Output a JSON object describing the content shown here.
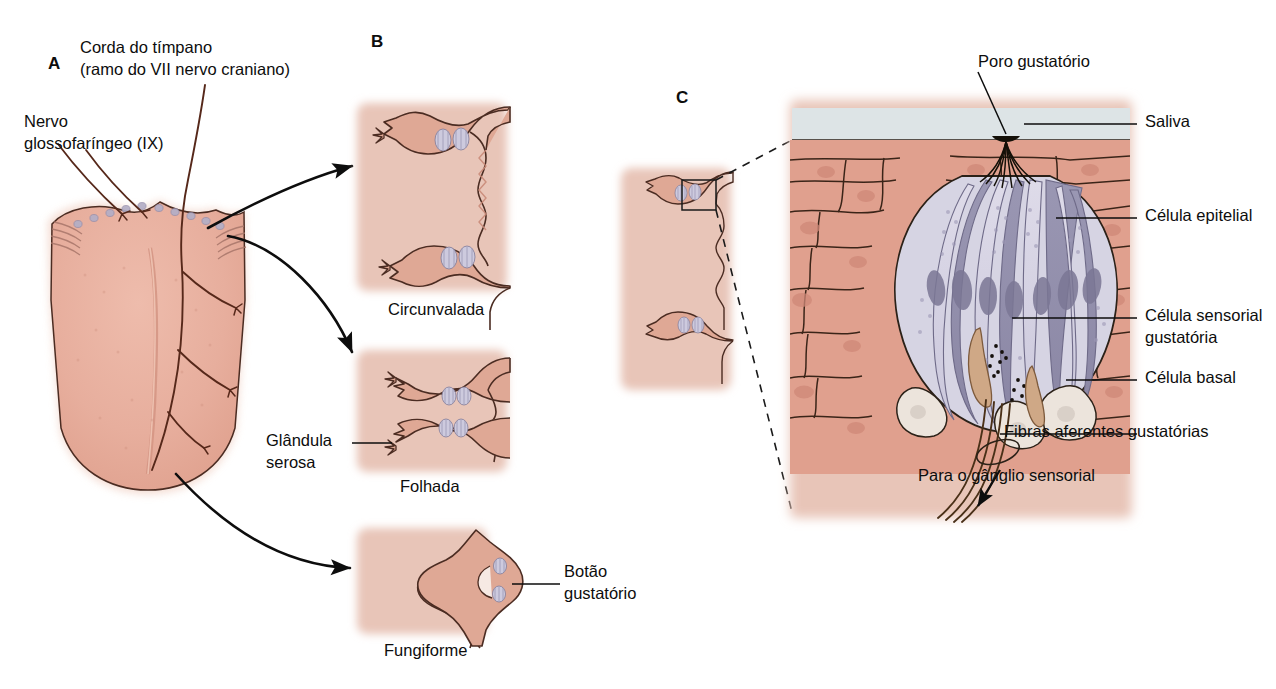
{
  "figure": {
    "language": "pt-BR"
  },
  "panels": [
    {
      "id": "A",
      "letter": "A",
      "name": "tongue-innervation"
    },
    {
      "id": "B",
      "letter": "B",
      "name": "papilla-types"
    },
    {
      "id": "C",
      "letter": "C",
      "name": "taste-bud-detail"
    }
  ],
  "panel_a": {
    "letter": "A",
    "labels": {
      "chorda_tympani_line1": "Corda do tímpano",
      "chorda_tympani_line2": "(ramo do VII nervo craniano)",
      "glossopharyngeal_line1": "Nervo",
      "glossopharyngeal_line2": "glossofaríngeo (IX)"
    }
  },
  "panel_b": {
    "letter": "B",
    "items": [
      {
        "name": "circumvallate",
        "caption": "Circunvalada"
      },
      {
        "name": "foliate",
        "caption": "Folhada"
      },
      {
        "name": "fungiform",
        "caption": "Fungiforme"
      }
    ],
    "labels": {
      "serous_gland_line1": "Glândula",
      "serous_gland_line2": "serosa",
      "taste_bud_line1": "Botão",
      "taste_bud_line2": "gustatório"
    }
  },
  "panel_c": {
    "letter": "C",
    "labels": {
      "taste_pore": "Poro gustatório",
      "saliva": "Saliva",
      "epithelial_cell": "Célula epitelial",
      "sensory_cell_line1": "Célula sensorial",
      "sensory_cell_line2": "gustatória",
      "basal_cell": "Célula basal",
      "afferent_fibers": "Fibras aferentes gustatórias",
      "to_ganglion": "Para o gânglio sensorial"
    }
  },
  "colors": {
    "tongue_pink": "#e8b0a0",
    "tissue_block": "#e8c5b8",
    "epithelium": "#e0a08e",
    "epithelium_nucleus": "#cf8878",
    "papilla_fill": "#dfa895",
    "taste_bud_light": "#d6d4e3",
    "taste_bud_dark": "#908da9",
    "basal_cell": "#ece4dc",
    "synapse_tan": "#cfa886",
    "saliva": "#dde4e6",
    "outline": "#2b2118",
    "nerve": "#4a2418",
    "arrow": "#0d0d0d"
  }
}
